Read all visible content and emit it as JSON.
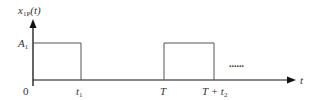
{
  "diagram": {
    "y_axis_label": "x",
    "y_axis_label_sub": "1P",
    "y_axis_label_arg": "(t)",
    "x_axis_label": "t",
    "amplitude_label": "A",
    "amplitude_label_sub": "1",
    "origin_label": "0",
    "tick_labels": {
      "t1": "t",
      "t1_sub": "1",
      "T": "T",
      "T_plus_t2": "T + t",
      "T_plus_t2_sub": "2"
    },
    "continuation": "......",
    "colors": {
      "axis": "#111111",
      "pulse": "#555555",
      "text": "#333333"
    }
  }
}
